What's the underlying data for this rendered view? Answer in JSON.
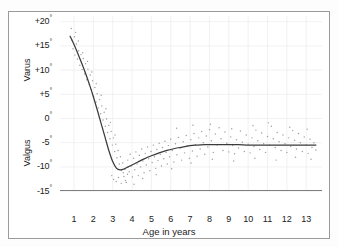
{
  "figure": {
    "background": "#ffffff",
    "frame_color": "#9a9a9a"
  },
  "axes": {
    "y_upper_label": "Varus",
    "y_lower_label": "Valgus",
    "x_title": "Age in years",
    "y_ticks": [
      "+20°",
      "+15°",
      "+10°",
      "+5°",
      "0°",
      "-5°",
      "-10°",
      "-15°"
    ],
    "x_ticks": [
      "1",
      "2",
      "3",
      "4",
      "5",
      "6",
      "7",
      "8",
      "9",
      "10",
      "11",
      "12",
      "13"
    ]
  },
  "chart_data": {
    "type": "scatter",
    "title": "",
    "subtitle": "",
    "xlabel": "Age in years",
    "ylabel": "Varus / Valgus angle (degrees)",
    "xlim": [
      0,
      13.8
    ],
    "ylim": [
      -17,
      21
    ],
    "grid": true,
    "legend": "none",
    "y_tick_values": [
      20,
      15,
      10,
      5,
      0,
      -5,
      -10,
      -15
    ],
    "x_tick_values": [
      1,
      2,
      3,
      4,
      5,
      6,
      7,
      8,
      9,
      10,
      11,
      12,
      13
    ],
    "annotations": [
      {
        "text": "Varus",
        "position": "y-axis-upper",
        "rotation": -90
      },
      {
        "text": "Valgus",
        "position": "y-axis-lower",
        "rotation": -90
      }
    ],
    "series": [
      {
        "name": "fitted mean curve",
        "type": "line",
        "color": "#3b3b3b",
        "x": [
          0.8,
          1.0,
          1.2,
          1.4,
          1.6,
          1.8,
          2.0,
          2.2,
          2.4,
          2.6,
          2.8,
          3.0,
          3.2,
          3.4,
          3.6,
          3.8,
          4.0,
          4.3,
          4.6,
          5.0,
          5.4,
          5.8,
          6.2,
          6.6,
          7.0,
          7.4,
          7.8,
          8.2,
          8.6,
          9.0,
          9.5,
          10.0,
          10.5,
          11.0,
          11.5,
          12.0,
          12.5,
          13.0,
          13.5
        ],
        "y": [
          17.0,
          15.3,
          13.4,
          11.4,
          9.3,
          7.0,
          4.5,
          1.8,
          -1.0,
          -3.8,
          -6.6,
          -8.9,
          -10.3,
          -10.6,
          -10.4,
          -10.0,
          -9.6,
          -9.0,
          -8.4,
          -7.7,
          -7.1,
          -6.6,
          -6.2,
          -5.9,
          -5.6,
          -5.5,
          -5.4,
          -5.4,
          -5.4,
          -5.4,
          -5.4,
          -5.5,
          -5.5,
          -5.5,
          -5.5,
          -5.5,
          -5.5,
          -5.5,
          -5.5
        ]
      },
      {
        "name": "individual measurements",
        "type": "scatter",
        "color": "#8e8e8e",
        "marker": "dot",
        "points": [
          [
            0.86,
            18.6
          ],
          [
            0.88,
            16.2
          ],
          [
            0.95,
            14.4
          ],
          [
            1.02,
            16.9
          ],
          [
            1.05,
            13.1
          ],
          [
            1.12,
            15.4
          ],
          [
            1.18,
            12.3
          ],
          [
            1.24,
            14.0
          ],
          [
            1.3,
            11.0
          ],
          [
            1.36,
            13.2
          ],
          [
            1.42,
            10.1
          ],
          [
            1.48,
            12.4
          ],
          [
            1.55,
            9.2
          ],
          [
            1.6,
            11.3
          ],
          [
            1.66,
            8.0
          ],
          [
            1.72,
            10.2
          ],
          [
            1.78,
            7.1
          ],
          [
            1.84,
            9.0
          ],
          [
            1.9,
            6.0
          ],
          [
            1.96,
            7.8
          ],
          [
            2.02,
            4.6
          ],
          [
            2.08,
            6.4
          ],
          [
            2.14,
            3.4
          ],
          [
            2.2,
            5.1
          ],
          [
            2.26,
            2.2
          ],
          [
            2.32,
            3.9
          ],
          [
            2.38,
            1.0
          ],
          [
            2.44,
            2.6
          ],
          [
            2.5,
            -0.3
          ],
          [
            2.56,
            1.3
          ],
          [
            2.62,
            -1.6
          ],
          [
            2.68,
            -0.1
          ],
          [
            2.74,
            -2.9
          ],
          [
            2.8,
            -1.4
          ],
          [
            2.86,
            -4.2
          ],
          [
            2.92,
            -2.7
          ],
          [
            2.98,
            -5.5
          ],
          [
            3.04,
            -4.0
          ],
          [
            3.1,
            -6.8
          ],
          [
            3.16,
            -5.3
          ],
          [
            3.22,
            -8.1
          ],
          [
            3.28,
            -6.6
          ],
          [
            3.34,
            -9.4
          ],
          [
            3.4,
            -7.9
          ],
          [
            3.46,
            -10.7
          ],
          [
            3.52,
            -9.2
          ],
          [
            3.58,
            -12.0
          ],
          [
            3.64,
            -10.5
          ],
          [
            3.7,
            -13.2
          ],
          [
            3.76,
            -11.5
          ],
          [
            2.95,
            -11.8
          ],
          [
            3.05,
            -12.6
          ],
          [
            3.18,
            -13.0
          ],
          [
            3.3,
            -12.2
          ],
          [
            3.44,
            -13.4
          ],
          [
            3.55,
            -11.2
          ],
          [
            3.66,
            -12.8
          ],
          [
            3.78,
            -8.6
          ],
          [
            3.85,
            -11.0
          ],
          [
            3.9,
            -7.4
          ],
          [
            3.96,
            -9.8
          ],
          [
            4.02,
            -12.1
          ],
          [
            4.08,
            -8.2
          ],
          [
            4.14,
            -10.6
          ],
          [
            4.2,
            -6.9
          ],
          [
            4.26,
            -9.4
          ],
          [
            4.32,
            -11.8
          ],
          [
            4.38,
            -7.6
          ],
          [
            4.44,
            -10.0
          ],
          [
            4.5,
            -6.3
          ],
          [
            4.56,
            -8.8
          ],
          [
            4.62,
            -11.2
          ],
          [
            4.68,
            -7.2
          ],
          [
            4.74,
            -9.6
          ],
          [
            4.8,
            -5.9
          ],
          [
            4.86,
            -8.3
          ],
          [
            4.92,
            -10.8
          ],
          [
            4.98,
            -6.8
          ],
          [
            5.04,
            -9.1
          ],
          [
            5.1,
            -5.5
          ],
          [
            5.16,
            -7.9
          ],
          [
            5.22,
            -10.3
          ],
          [
            5.28,
            -6.4
          ],
          [
            5.34,
            -8.7
          ],
          [
            5.4,
            -5.1
          ],
          [
            5.46,
            -7.4
          ],
          [
            5.52,
            -9.8
          ],
          [
            5.58,
            -6.0
          ],
          [
            5.64,
            -8.3
          ],
          [
            5.7,
            -4.7
          ],
          [
            5.76,
            -7.0
          ],
          [
            5.82,
            -9.4
          ],
          [
            5.88,
            -5.6
          ],
          [
            5.94,
            -7.9
          ],
          [
            6.0,
            -4.3
          ],
          [
            6.08,
            -6.6
          ],
          [
            6.16,
            -9.0
          ],
          [
            6.24,
            -5.2
          ],
          [
            6.32,
            -7.5
          ],
          [
            6.4,
            -3.9
          ],
          [
            6.48,
            -6.2
          ],
          [
            6.56,
            -8.6
          ],
          [
            6.64,
            -4.8
          ],
          [
            6.72,
            -7.1
          ],
          [
            6.8,
            -3.5
          ],
          [
            6.88,
            -5.8
          ],
          [
            6.96,
            -8.2
          ],
          [
            7.04,
            -4.4
          ],
          [
            7.12,
            -6.7
          ],
          [
            7.2,
            -3.1
          ],
          [
            7.28,
            -5.4
          ],
          [
            7.36,
            -7.8
          ],
          [
            7.44,
            -4.0
          ],
          [
            7.52,
            -6.3
          ],
          [
            7.6,
            -2.7
          ],
          [
            7.68,
            -5.0
          ],
          [
            7.76,
            -7.4
          ],
          [
            7.84,
            -3.6
          ],
          [
            7.92,
            -5.9
          ],
          [
            8.0,
            -2.3
          ],
          [
            8.1,
            -4.6
          ],
          [
            8.2,
            -7.0
          ],
          [
            8.3,
            -3.2
          ],
          [
            8.4,
            -5.5
          ],
          [
            8.5,
            -1.9
          ],
          [
            8.6,
            -4.2
          ],
          [
            8.7,
            -6.6
          ],
          [
            8.8,
            -2.8
          ],
          [
            8.9,
            -5.1
          ],
          [
            9.0,
            -6.9
          ],
          [
            9.1,
            -3.8
          ],
          [
            9.2,
            -5.6
          ],
          [
            9.3,
            -7.3
          ],
          [
            9.4,
            -4.4
          ],
          [
            9.5,
            -6.1
          ],
          [
            9.6,
            -2.6
          ],
          [
            9.7,
            -4.9
          ],
          [
            9.8,
            -6.8
          ],
          [
            9.9,
            -3.4
          ],
          [
            10.0,
            -5.3
          ],
          [
            10.1,
            -7.1
          ],
          [
            10.2,
            -4.0
          ],
          [
            10.3,
            -5.8
          ],
          [
            10.4,
            -2.4
          ],
          [
            10.5,
            -4.6
          ],
          [
            10.6,
            -6.4
          ],
          [
            10.7,
            -3.0
          ],
          [
            10.8,
            -5.2
          ],
          [
            10.9,
            -7.0
          ],
          [
            11.0,
            -3.7
          ],
          [
            11.1,
            -5.5
          ],
          [
            11.2,
            -1.6
          ],
          [
            11.3,
            -4.2
          ],
          [
            11.4,
            -6.0
          ],
          [
            11.5,
            -2.9
          ],
          [
            11.6,
            -4.8
          ],
          [
            11.7,
            -6.6
          ],
          [
            11.8,
            -3.4
          ],
          [
            11.9,
            -5.2
          ],
          [
            12.0,
            -7.0
          ],
          [
            12.1,
            -4.0
          ],
          [
            12.2,
            -5.8
          ],
          [
            12.3,
            -2.5
          ],
          [
            12.4,
            -4.5
          ],
          [
            12.5,
            -6.3
          ],
          [
            12.6,
            -3.1
          ],
          [
            12.7,
            -5.0
          ],
          [
            12.8,
            -6.8
          ],
          [
            12.9,
            -3.8
          ],
          [
            13.0,
            -5.5
          ],
          [
            13.1,
            -7.2
          ],
          [
            13.2,
            -4.3
          ],
          [
            13.3,
            -6.0
          ],
          [
            13.4,
            -5.0
          ],
          [
            13.5,
            -6.5
          ],
          [
            6.3,
            -2.0
          ],
          [
            7.15,
            -1.4
          ],
          [
            8.05,
            -1.2
          ],
          [
            9.15,
            -2.1
          ],
          [
            10.25,
            -1.5
          ],
          [
            11.05,
            -0.9
          ],
          [
            12.15,
            -1.8
          ],
          [
            13.05,
            -2.2
          ],
          [
            4.1,
            -13.6
          ],
          [
            4.55,
            -12.4
          ],
          [
            5.25,
            -11.6
          ],
          [
            6.05,
            -10.4
          ],
          [
            7.05,
            -9.2
          ],
          [
            8.15,
            -8.4
          ],
          [
            9.25,
            -8.8
          ],
          [
            10.35,
            -8.2
          ],
          [
            11.45,
            -8.6
          ],
          [
            12.45,
            -8.0
          ],
          [
            13.25,
            -8.4
          ],
          [
            1.08,
            17.8
          ],
          [
            1.22,
            16.0
          ],
          [
            1.45,
            13.6
          ],
          [
            1.7,
            11.8
          ],
          [
            1.92,
            9.6
          ],
          [
            2.15,
            7.2
          ],
          [
            2.4,
            4.8
          ],
          [
            2.65,
            2.0
          ],
          [
            2.88,
            -0.8
          ],
          [
            3.12,
            -3.4
          ]
        ]
      }
    ]
  }
}
